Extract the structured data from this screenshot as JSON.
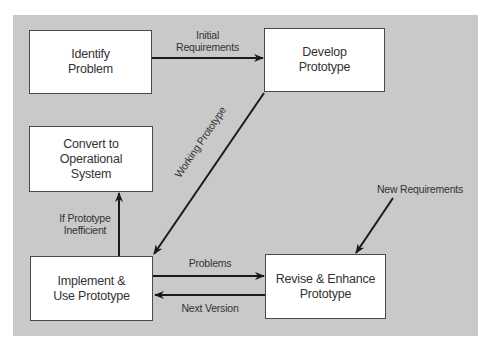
{
  "diagram": {
    "colors": {
      "panel_background": "#c9c9c9",
      "box_fill": "#ffffff",
      "box_border": "#4a4a4a",
      "arrow": "#1a1a1a",
      "text": "#333333"
    },
    "nodes": {
      "identify_problem": "Identify\nProblem",
      "develop_prototype": "Develop\nPrototype",
      "convert_to_operational": "Convert to\nOperational\nSystem",
      "implement_use_prototype": "Implement &\nUse Prototype",
      "revise_enhance_prototype": "Revise & Enhance\nPrototype"
    },
    "edges": {
      "initial_requirements": "Initial\nRequirements",
      "working_prototype": "Working Prototype",
      "if_prototype_inefficient": "If Prototype\nInefficient",
      "problems": "Problems",
      "next_version": "Next Version",
      "new_requirements": "New Requirements"
    }
  }
}
